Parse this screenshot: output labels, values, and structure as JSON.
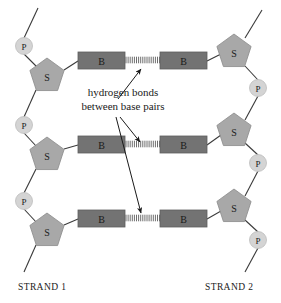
{
  "figure": {
    "background_color": "#ffffff"
  },
  "colors": {
    "base_fill": "#737373",
    "sugar_fill": "#a8a8a8",
    "phosphate_fill": "#d4d4d4",
    "backbone_line": "#3a3a3a",
    "text": "#1a1a1a",
    "hydrogen_bond": "#6e6e6e"
  },
  "legend": {
    "base_letter": "B",
    "sugar_letter": "S",
    "phosphate_letter": "P"
  },
  "callout": {
    "line1": "hydrogen bonds",
    "line2": "between base pairs"
  },
  "strand_labels": {
    "left": "STRAND 1",
    "right": "STRAND 2"
  },
  "strand1": {
    "phosphates": [
      {
        "label": "P",
        "cx": 24,
        "cy": 46
      },
      {
        "label": "P",
        "cx": 24,
        "cy": 125
      },
      {
        "label": "P",
        "cx": 24,
        "cy": 201
      }
    ],
    "sugars": [
      {
        "label": "S",
        "cx": 47,
        "cy": 76
      },
      {
        "label": "S",
        "cx": 47,
        "cy": 155
      },
      {
        "label": "S",
        "cx": 47,
        "cy": 231
      }
    ],
    "bases": [
      {
        "label": "B",
        "x": 78,
        "y": 52,
        "w": 47,
        "h": 17
      },
      {
        "label": "B",
        "x": 78,
        "y": 136,
        "w": 47,
        "h": 17
      },
      {
        "label": "B",
        "x": 78,
        "y": 210,
        "w": 47,
        "h": 17
      }
    ]
  },
  "strand2": {
    "phosphates": [
      {
        "label": "P",
        "cx": 258,
        "cy": 88
      },
      {
        "label": "P",
        "cx": 258,
        "cy": 163
      },
      {
        "label": "P",
        "cx": 258,
        "cy": 240
      }
    ],
    "sugars": [
      {
        "label": "S",
        "cx": 234,
        "cy": 52
      },
      {
        "label": "S",
        "cx": 234,
        "cy": 131
      },
      {
        "label": "S",
        "cx": 234,
        "cy": 207
      }
    ],
    "bases": [
      {
        "label": "B",
        "x": 160,
        "y": 52,
        "w": 47,
        "h": 17
      },
      {
        "label": "B",
        "x": 160,
        "y": 136,
        "w": 47,
        "h": 17
      },
      {
        "label": "B",
        "x": 160,
        "y": 210,
        "w": 47,
        "h": 17
      }
    ]
  },
  "hydrogen_bonds": [
    {
      "x1": 125,
      "x2": 160,
      "y": 60
    },
    {
      "x1": 125,
      "x2": 160,
      "y": 144
    },
    {
      "x1": 125,
      "x2": 160,
      "y": 218
    }
  ],
  "arrows": [
    {
      "name": "arrow-to-top-bond",
      "x1": 118,
      "y1": 99,
      "x2": 141,
      "y2": 69
    },
    {
      "name": "arrow-to-middle-bond",
      "x1": 120,
      "y1": 117,
      "x2": 140,
      "y2": 142
    },
    {
      "name": "arrow-to-bottom-bond",
      "x1": 116,
      "y1": 117,
      "x2": 141,
      "y2": 213
    }
  ]
}
